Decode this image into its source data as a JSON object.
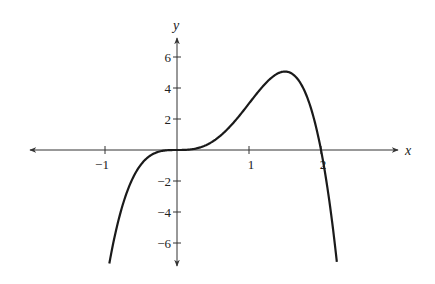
{
  "chart_data": {
    "type": "line",
    "title": "",
    "xlabel": "x",
    "ylabel": "y",
    "function": "y = 6x^3 - 3x^4 = 3x^3(2 - x)",
    "x_ticks": [
      -1,
      1,
      2
    ],
    "x_tick_labels": [
      "−1",
      "1",
      "2"
    ],
    "y_ticks": [
      6,
      4,
      2,
      -2,
      -4,
      -6
    ],
    "y_tick_labels": [
      "6",
      "4",
      "2",
      "−2",
      "−4",
      "−6"
    ],
    "xlim": [
      -2.1,
      3.1
    ],
    "ylim": [
      -7.5,
      7.2
    ],
    "grid": false,
    "legend": null,
    "series": [
      {
        "name": "f(x)",
        "x": [
          -0.94,
          -0.9,
          -0.8,
          -0.7,
          -0.6,
          -0.5,
          -0.4,
          -0.3,
          -0.2,
          -0.1,
          0,
          0.1,
          0.2,
          0.3,
          0.4,
          0.5,
          0.6,
          0.7,
          0.8,
          0.9,
          1.0,
          1.1,
          1.2,
          1.3,
          1.4,
          1.5,
          1.6,
          1.7,
          1.8,
          1.9,
          2.0,
          2.1,
          2.22
        ],
        "y": [
          -7.32,
          -6.34,
          -4.3,
          -2.78,
          -1.69,
          -0.94,
          -0.46,
          -0.19,
          -0.05,
          -0.01,
          0,
          0.01,
          0.04,
          0.14,
          0.31,
          0.56,
          0.91,
          1.34,
          1.84,
          2.4,
          3.0,
          3.59,
          4.15,
          4.61,
          4.94,
          5.06,
          4.92,
          4.42,
          3.5,
          2.06,
          0,
          -2.78,
          -7.24
        ]
      }
    ]
  },
  "axes": {
    "x_label": "x",
    "y_label": "y"
  }
}
